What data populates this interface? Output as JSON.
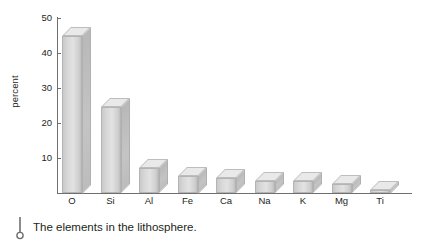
{
  "chart_data": {
    "type": "bar",
    "title": "",
    "xlabel": "",
    "ylabel": "percent",
    "ylim": [
      0,
      50
    ],
    "yticks": [
      10,
      20,
      30,
      40,
      50
    ],
    "grid": false,
    "legend": false,
    "style": "3d-bar",
    "categories": [
      "O",
      "Si",
      "Al",
      "Fe",
      "Ca",
      "Na",
      "K",
      "Mg",
      "Ti"
    ],
    "values": [
      45,
      24.5,
      7.2,
      5,
      4.3,
      3.5,
      3.3,
      2.5,
      1
    ],
    "bar_color": "#dcdcdc",
    "bar_top_color": "#e9e9e9",
    "bar_side_color": "#bebebe",
    "axis_color": "#6f6f6f"
  },
  "caption": {
    "icon": "pin-marker-icon",
    "text": "The elements in the lithosphere."
  }
}
